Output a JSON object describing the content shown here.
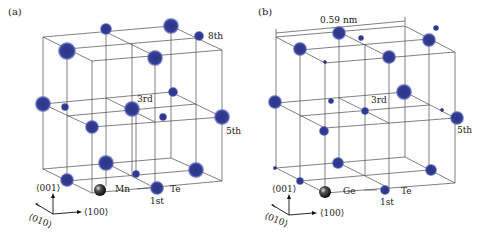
{
  "panels": [
    {
      "id": "a",
      "label": "(a)",
      "cell_label": "",
      "element_label": "Mn",
      "second_label": "Te",
      "neighbor_labels": {
        "first": "1st",
        "third": "3rd",
        "fifth": "5th",
        "eighth": "8th"
      },
      "axis_labels": {
        "z": "⟨001⟩",
        "x": "⟨100⟩",
        "y": "⟨010⟩"
      },
      "origin": {
        "x": 100,
        "y": 188
      },
      "atoms": [
        {
          "x": 106,
          "y": 29,
          "r": 6
        },
        {
          "x": 171,
          "y": 26,
          "r": 8
        },
        {
          "x": 199,
          "y": 36,
          "r": 5
        },
        {
          "x": 67,
          "y": 51,
          "r": 9
        },
        {
          "x": 155,
          "y": 58,
          "r": 8
        },
        {
          "x": 173,
          "y": 92,
          "r": 5
        },
        {
          "x": 43,
          "y": 104,
          "r": 8
        },
        {
          "x": 65,
          "y": 107,
          "r": 4
        },
        {
          "x": 132,
          "y": 109,
          "r": 8
        },
        {
          "x": 163,
          "y": 117,
          "r": 4
        },
        {
          "x": 222,
          "y": 117,
          "r": 8
        },
        {
          "x": 92,
          "y": 127,
          "r": 7
        },
        {
          "x": 106,
          "y": 163,
          "r": 8
        },
        {
          "x": 136,
          "y": 174,
          "r": 4
        },
        {
          "x": 196,
          "y": 170,
          "r": 8
        },
        {
          "x": 67,
          "y": 180,
          "r": 7
        },
        {
          "x": 157,
          "y": 188,
          "r": 7
        }
      ]
    },
    {
      "id": "b",
      "label": "(b)",
      "cell_label": "0.59 nm",
      "element_label": "Ge",
      "second_label": "Te",
      "neighbor_labels": {
        "first": "1st",
        "third": "3rd",
        "fifth": "5th"
      },
      "axis_labels": {
        "z": "⟨001⟩",
        "x": "⟨100⟩",
        "y": "⟨010⟩"
      },
      "origin": {
        "x": 325,
        "y": 192
      },
      "atoms": [
        {
          "x": 339,
          "y": 33,
          "r": 7
        },
        {
          "x": 361,
          "y": 38,
          "r": 3
        },
        {
          "x": 429,
          "y": 40,
          "r": 7
        },
        {
          "x": 436,
          "y": 28,
          "r": 3
        },
        {
          "x": 300,
          "y": 49,
          "r": 7
        },
        {
          "x": 389,
          "y": 57,
          "r": 7
        },
        {
          "x": 325,
          "y": 62,
          "r": 2
        },
        {
          "x": 404,
          "y": 92,
          "r": 8
        },
        {
          "x": 275,
          "y": 102,
          "r": 7
        },
        {
          "x": 331,
          "y": 101,
          "r": 3
        },
        {
          "x": 365,
          "y": 111,
          "r": 4
        },
        {
          "x": 442,
          "y": 110,
          "r": 2
        },
        {
          "x": 457,
          "y": 118,
          "r": 7
        },
        {
          "x": 324,
          "y": 131,
          "r": 5
        },
        {
          "x": 338,
          "y": 163,
          "r": 6
        },
        {
          "x": 431,
          "y": 170,
          "r": 6
        },
        {
          "x": 275,
          "y": 168,
          "r": 2
        },
        {
          "x": 300,
          "y": 181,
          "r": 4
        },
        {
          "x": 385,
          "y": 190,
          "r": 5
        }
      ]
    }
  ],
  "colors": {
    "atom": "#2e3a8c",
    "atom_edge": "#4b58b0",
    "line": "#4a4a4a",
    "origin_atom": "#222222"
  }
}
